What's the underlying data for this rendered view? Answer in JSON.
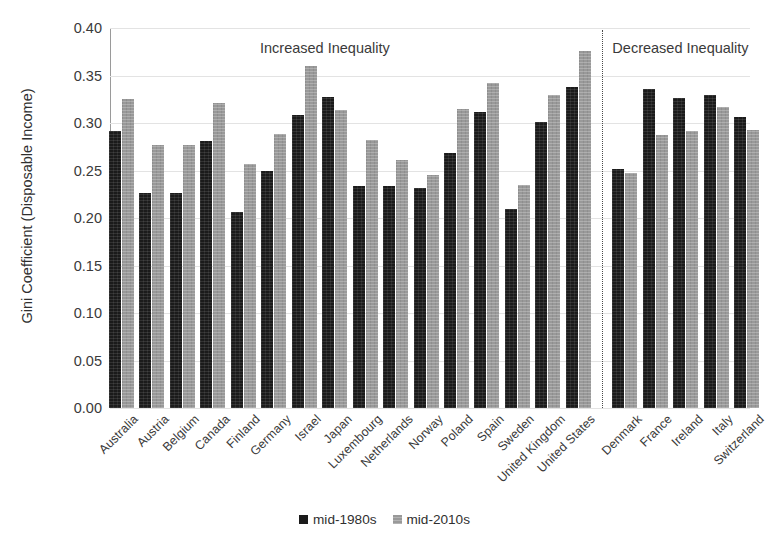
{
  "chart_data": {
    "type": "bar",
    "title": "",
    "xlabel": "",
    "ylabel": "Gini Coefficient (Disposable Income)",
    "ylim": [
      0.0,
      0.4
    ],
    "ytick_labels": [
      "0.00",
      "0.05",
      "0.10",
      "0.15",
      "0.20",
      "0.25",
      "0.30",
      "0.35",
      "0.40"
    ],
    "ytick_values": [
      0.0,
      0.05,
      0.1,
      0.15,
      0.2,
      0.25,
      0.3,
      0.35,
      0.4
    ],
    "grid": true,
    "legend_position": "bottom-center",
    "categories": [
      "Australia",
      "Austria",
      "Belgium",
      "Canada",
      "Finland",
      "Germany",
      "Israel",
      "Japan",
      "Luxembourg",
      "Netherlands",
      "Norway",
      "Poland",
      "Spain",
      "Sweden",
      "United Kingdom",
      "United States",
      "Denmark",
      "France",
      "Ireland",
      "Italy",
      "Switzerland"
    ],
    "series": [
      {
        "name": "mid-1980s",
        "color": "#1b1b1b",
        "values": [
          0.292,
          0.226,
          0.226,
          0.281,
          0.206,
          0.25,
          0.308,
          0.327,
          0.234,
          0.234,
          0.232,
          0.268,
          0.312,
          0.209,
          0.301,
          0.338,
          0.252,
          0.336,
          0.326,
          0.329,
          0.306
        ]
      },
      {
        "name": "mid-2010s",
        "color": "#999999",
        "values": [
          0.325,
          0.277,
          0.277,
          0.321,
          0.257,
          0.288,
          0.36,
          0.314,
          0.282,
          0.261,
          0.245,
          0.315,
          0.342,
          0.235,
          0.329,
          0.376,
          0.247,
          0.287,
          0.292,
          0.317,
          0.293
        ]
      }
    ],
    "annotations": [
      {
        "text": "Increased Inequality",
        "group_start": "Australia",
        "group_end": "United States"
      },
      {
        "text": "Decreased Inequality",
        "group_start": "Denmark",
        "group_end": "Switzerland"
      }
    ],
    "divider": {
      "after_category": "United States",
      "style": "dotted"
    }
  },
  "legend": {
    "items": [
      {
        "label": "mid-1980s"
      },
      {
        "label": "mid-2010s"
      }
    ]
  }
}
